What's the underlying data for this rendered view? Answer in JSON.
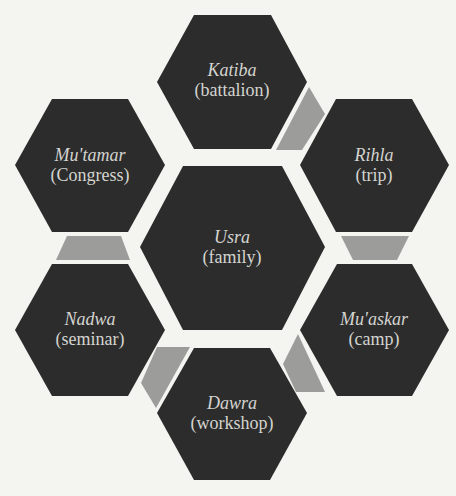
{
  "colors": {
    "background": "#f4f4f1",
    "hexagon_fill": "#2c2c2c",
    "connector_fill": "#9c9c9a",
    "label_text": "#d4d4d0"
  },
  "hexagons": [
    {
      "id": "usra",
      "term": "Usra",
      "gloss": "(family)",
      "position": "center"
    },
    {
      "id": "katiba",
      "term": "Katiba",
      "gloss": "(battalion)",
      "position": "top"
    },
    {
      "id": "rihla",
      "term": "Rihla",
      "gloss": "(trip)",
      "position": "upper-right"
    },
    {
      "id": "muaskar",
      "term": "Mu'askar",
      "gloss": "(camp)",
      "position": "lower-right"
    },
    {
      "id": "dawra",
      "term": "Dawra",
      "gloss": "(workshop)",
      "position": "bottom"
    },
    {
      "id": "nadwa",
      "term": "Nadwa",
      "gloss": "(seminar)",
      "position": "lower-left"
    },
    {
      "id": "mutamar",
      "term": "Mu'tamar",
      "gloss": "(Congress)",
      "position": "upper-left"
    }
  ],
  "connectors": [
    {
      "from": "katiba",
      "to": "rihla"
    },
    {
      "from": "rihla",
      "to": "muaskar"
    },
    {
      "from": "muaskar",
      "to": "dawra"
    },
    {
      "from": "dawra",
      "to": "nadwa"
    },
    {
      "from": "nadwa",
      "to": "mutamar"
    }
  ]
}
